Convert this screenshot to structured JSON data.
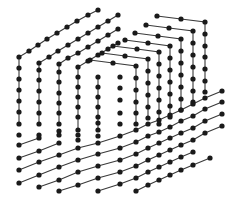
{
  "illustration": {
    "title": "dotted lattice cube",
    "colors": {
      "background": "#ffffff",
      "line": "#3a3a3a",
      "dot": "#1a1a1a"
    },
    "dot_radius": 2.6,
    "paths": [
      {
        "name": "left-l-1",
        "points": [
          [
            98,
            10
          ],
          [
            88,
            15
          ],
          [
            77,
            21
          ],
          [
            67,
            27
          ],
          [
            57,
            33
          ],
          [
            47,
            39
          ],
          [
            38,
            45
          ],
          [
            29,
            51
          ],
          [
            19,
            57
          ],
          [
            19,
            68
          ],
          [
            19,
            79
          ],
          [
            19,
            90
          ],
          [
            19,
            101
          ],
          [
            19,
            112
          ],
          [
            19,
            124
          ]
        ]
      },
      {
        "name": "left-l-2",
        "points": [
          [
            118,
            15
          ],
          [
            108,
            21
          ],
          [
            98,
            27
          ],
          [
            88,
            33
          ],
          [
            78,
            39
          ],
          [
            68,
            45
          ],
          [
            58,
            51
          ],
          [
            49,
            57
          ],
          [
            39,
            63
          ],
          [
            39,
            70
          ],
          [
            39,
            80
          ],
          [
            39,
            91
          ],
          [
            39,
            102
          ],
          [
            39,
            113
          ],
          [
            39,
            124
          ]
        ]
      },
      {
        "name": "left-l-3",
        "points": [
          [
            118,
            29
          ],
          [
            108,
            35
          ],
          [
            98,
            41
          ],
          [
            88,
            47
          ],
          [
            78,
            53
          ],
          [
            68,
            58
          ],
          [
            59,
            64
          ],
          [
            59,
            72
          ],
          [
            59,
            82
          ],
          [
            59,
            93
          ],
          [
            59,
            103
          ],
          [
            59,
            113
          ],
          [
            59,
            124
          ]
        ]
      },
      {
        "name": "left-l-4",
        "points": [
          [
            118,
            43
          ],
          [
            108,
            49
          ],
          [
            98,
            55
          ],
          [
            88,
            61
          ],
          [
            78,
            67
          ],
          [
            78,
            77
          ],
          [
            78,
            87
          ],
          [
            78,
            97
          ],
          [
            78,
            107
          ],
          [
            78,
            117
          ],
          [
            78,
            130
          ]
        ]
      },
      {
        "name": "back-1",
        "points": [
          [
            157,
            16
          ],
          [
            181,
            19
          ],
          [
            205,
            22
          ],
          [
            205,
            34
          ],
          [
            205,
            46
          ],
          [
            205,
            57
          ],
          [
            205,
            69
          ],
          [
            205,
            81
          ],
          [
            205,
            92
          ]
        ]
      },
      {
        "name": "back-2",
        "points": [
          [
            146,
            25
          ],
          [
            169,
            28
          ],
          [
            193,
            31
          ],
          [
            193,
            43
          ],
          [
            193,
            55
          ],
          [
            193,
            67
          ],
          [
            193,
            79
          ],
          [
            193,
            91
          ],
          [
            193,
            102
          ]
        ]
      },
      {
        "name": "back-3",
        "points": [
          [
            135,
            33
          ],
          [
            158,
            36
          ],
          [
            181,
            39
          ],
          [
            181,
            51
          ],
          [
            181,
            63
          ],
          [
            181,
            75
          ],
          [
            181,
            87
          ],
          [
            181,
            99
          ],
          [
            181,
            110
          ]
        ]
      },
      {
        "name": "back-4",
        "points": [
          [
            125,
            40
          ],
          [
            148,
            43
          ],
          [
            170,
            46
          ],
          [
            170,
            58
          ],
          [
            170,
            70
          ],
          [
            170,
            82
          ],
          [
            170,
            94
          ],
          [
            170,
            106
          ],
          [
            170,
            117
          ]
        ]
      },
      {
        "name": "back-5",
        "points": [
          [
            113,
            46
          ],
          [
            137,
            49
          ],
          [
            159,
            52
          ],
          [
            159,
            64
          ],
          [
            159,
            76
          ],
          [
            159,
            88
          ],
          [
            159,
            100
          ],
          [
            159,
            112
          ],
          [
            159,
            124
          ]
        ]
      },
      {
        "name": "back-6",
        "points": [
          [
            102,
            53
          ],
          [
            125,
            56
          ],
          [
            148,
            59
          ],
          [
            148,
            71
          ],
          [
            148,
            83
          ],
          [
            148,
            95
          ],
          [
            148,
            107
          ],
          [
            148,
            118
          ]
        ]
      },
      {
        "name": "back-7",
        "points": [
          [
            90,
            60
          ],
          [
            113,
            63
          ],
          [
            136,
            66
          ],
          [
            136,
            78
          ],
          [
            136,
            90
          ],
          [
            136,
            102
          ],
          [
            136,
            113
          ],
          [
            136,
            124
          ]
        ]
      },
      {
        "name": "back-8",
        "points": [
          [
            98,
            77
          ],
          [
            98,
            87
          ],
          [
            98,
            97
          ],
          [
            98,
            107
          ],
          [
            98,
            117
          ],
          [
            98,
            130
          ]
        ]
      },
      {
        "name": "bottom-1",
        "points": [
          [
            19,
            145
          ],
          [
            39,
            138
          ]
        ]
      },
      {
        "name": "bottom-2",
        "points": [
          [
            19,
            158
          ],
          [
            39,
            151
          ],
          [
            59,
            143
          ]
        ]
      },
      {
        "name": "bottom-3",
        "points": [
          [
            19,
            170
          ],
          [
            39,
            162
          ],
          [
            59,
            155
          ],
          [
            78,
            148
          ],
          [
            98,
            143
          ],
          [
            120,
            136
          ],
          [
            136,
            130
          ],
          [
            148,
            124
          ],
          [
            159,
            120
          ],
          [
            170,
            115
          ],
          [
            181,
            110
          ],
          [
            193,
            104
          ],
          [
            205,
            98
          ],
          [
            222,
            91
          ]
        ]
      },
      {
        "name": "bottom-4",
        "points": [
          [
            19,
            183
          ],
          [
            39,
            175
          ],
          [
            59,
            167
          ],
          [
            78,
            160
          ],
          [
            98,
            154
          ],
          [
            120,
            148
          ],
          [
            136,
            142
          ],
          [
            148,
            136
          ],
          [
            159,
            132
          ],
          [
            170,
            127
          ],
          [
            181,
            121
          ],
          [
            193,
            116
          ],
          [
            205,
            109
          ],
          [
            222,
            102
          ]
        ]
      },
      {
        "name": "bottom-5",
        "points": [
          [
            39,
            187
          ],
          [
            59,
            180
          ],
          [
            78,
            172
          ],
          [
            98,
            166
          ],
          [
            120,
            160
          ],
          [
            136,
            154
          ],
          [
            148,
            148
          ],
          [
            159,
            143
          ],
          [
            170,
            138
          ],
          [
            181,
            133
          ],
          [
            193,
            128
          ],
          [
            205,
            121
          ],
          [
            222,
            114
          ]
        ]
      },
      {
        "name": "bottom-6",
        "points": [
          [
            59,
            191
          ],
          [
            78,
            185
          ],
          [
            98,
            178
          ],
          [
            120,
            172
          ],
          [
            136,
            166
          ],
          [
            148,
            160
          ],
          [
            159,
            155
          ],
          [
            170,
            150
          ],
          [
            181,
            145
          ],
          [
            193,
            140
          ],
          [
            205,
            133
          ],
          [
            222,
            126
          ]
        ]
      },
      {
        "name": "bottom-7",
        "points": [
          [
            98,
            191
          ],
          [
            120,
            184
          ],
          [
            136,
            178
          ],
          [
            148,
            172
          ],
          [
            159,
            167
          ],
          [
            170,
            162
          ],
          [
            181,
            157
          ],
          [
            193,
            152
          ]
        ]
      },
      {
        "name": "bottom-8",
        "points": [
          [
            136,
            191
          ],
          [
            148,
            185
          ],
          [
            159,
            180
          ],
          [
            170,
            175
          ],
          [
            181,
            170
          ],
          [
            193,
            165
          ],
          [
            210,
            158
          ]
        ]
      }
    ],
    "loose_dots": [
      [
        19,
        135
      ],
      [
        39,
        135
      ],
      [
        59,
        131
      ],
      [
        78,
        140
      ],
      [
        98,
        136
      ],
      [
        98,
        123
      ],
      [
        120,
        124
      ],
      [
        120,
        113
      ],
      [
        120,
        100
      ],
      [
        120,
        88
      ],
      [
        120,
        77
      ],
      [
        59,
        135
      ],
      [
        78,
        135
      ]
    ]
  }
}
